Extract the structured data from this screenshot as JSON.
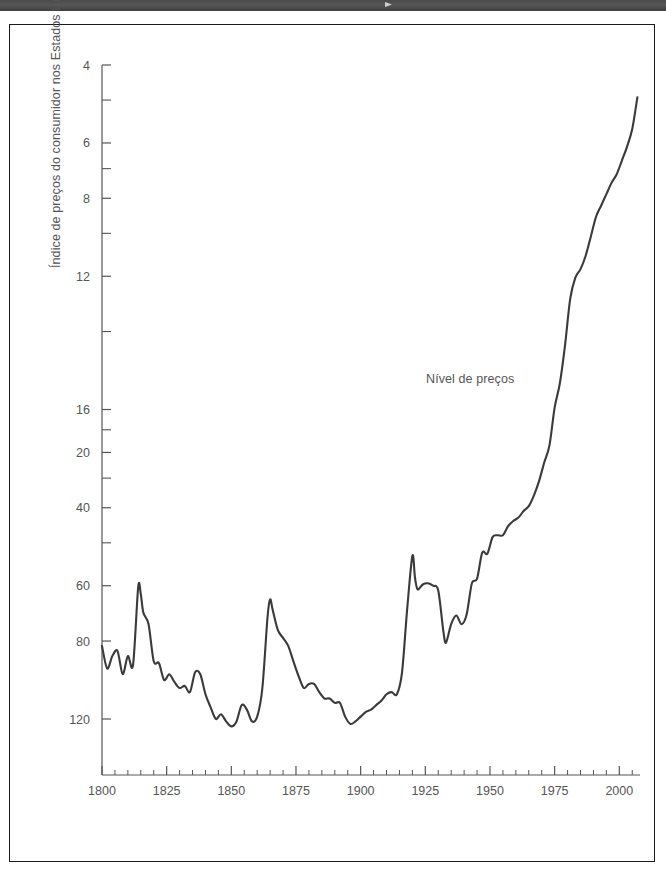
{
  "header": {
    "band_text": "",
    "marker": "triangle-marker"
  },
  "chart_data": {
    "type": "line",
    "title": "",
    "xlabel": "",
    "ylabel": "Índice de preços do consumidor nos Estados Unidos",
    "yscale": "log",
    "ylim": [
      3.0,
      120
    ],
    "xlim": [
      1800,
      2008
    ],
    "grid": false,
    "legend_position": "none",
    "annotations": [
      {
        "text": "Nível de preços",
        "x": 1958,
        "y": 26
      }
    ],
    "y_ticks_labeled": [
      4,
      6,
      8,
      12,
      16,
      20,
      40,
      60,
      80,
      120
    ],
    "y_ticks_minor": [
      10,
      14,
      18,
      30,
      50,
      70,
      100
    ],
    "x_ticks_labeled": [
      1800,
      1825,
      1850,
      1875,
      1900,
      1925,
      1950,
      1975,
      2000
    ],
    "x_tick_minor_step": 5,
    "series": [
      {
        "name": "Nível de preços",
        "color": "#3a3a3a",
        "x": [
          1800,
          1802,
          1804,
          1806,
          1808,
          1810,
          1812,
          1814,
          1815,
          1816,
          1818,
          1820,
          1822,
          1824,
          1826,
          1828,
          1830,
          1832,
          1834,
          1836,
          1838,
          1840,
          1842,
          1844,
          1846,
          1848,
          1850,
          1852,
          1854,
          1856,
          1858,
          1860,
          1862,
          1864,
          1865,
          1866,
          1868,
          1870,
          1872,
          1874,
          1876,
          1878,
          1880,
          1882,
          1884,
          1886,
          1888,
          1890,
          1892,
          1894,
          1896,
          1898,
          1900,
          1902,
          1904,
          1906,
          1908,
          1910,
          1912,
          1914,
          1916,
          1918,
          1920,
          1921,
          1922,
          1924,
          1926,
          1928,
          1930,
          1932,
          1933,
          1935,
          1937,
          1939,
          1941,
          1943,
          1945,
          1947,
          1949,
          1951,
          1953,
          1955,
          1957,
          1959,
          1961,
          1963,
          1965,
          1967,
          1969,
          1971,
          1973,
          1975,
          1977,
          1979,
          1981,
          1983,
          1985,
          1987,
          1989,
          1991,
          1993,
          1995,
          1997,
          1999,
          2001,
          2003,
          2005,
          2007
        ],
        "y": [
          5.85,
          5.2,
          5.55,
          5.7,
          5.05,
          5.55,
          5.3,
          7.95,
          7.65,
          6.95,
          6.55,
          5.4,
          5.35,
          4.9,
          5.05,
          4.85,
          4.7,
          4.75,
          4.6,
          5.1,
          5.05,
          4.55,
          4.25,
          4.0,
          4.1,
          3.95,
          3.85,
          3.95,
          4.3,
          4.2,
          3.95,
          4.05,
          4.7,
          6.8,
          7.45,
          7.05,
          6.35,
          6.1,
          5.85,
          5.4,
          5.0,
          4.7,
          4.8,
          4.8,
          4.6,
          4.45,
          4.45,
          4.35,
          4.35,
          4.05,
          3.9,
          3.95,
          4.05,
          4.15,
          4.2,
          4.3,
          4.4,
          4.55,
          4.6,
          4.55,
          5.1,
          7.1,
          9.35,
          8.35,
          7.85,
          8.05,
          8.1,
          8.0,
          7.8,
          6.3,
          5.95,
          6.55,
          6.85,
          6.55,
          6.9,
          8.1,
          8.3,
          9.5,
          9.45,
          10.3,
          10.4,
          10.4,
          10.9,
          11.2,
          11.4,
          11.8,
          12.1,
          12.8,
          13.8,
          15.2,
          16.6,
          20.2,
          22.9,
          27.9,
          35.5,
          39.7,
          41.5,
          44.5,
          49.2,
          54.5,
          57.8,
          61.3,
          65.0,
          68.0,
          73.0,
          78.5,
          86.0,
          101.5
        ]
      }
    ]
  },
  "axes": {
    "y_tick_labels": [
      "120",
      "80",
      "60",
      "40",
      "20",
      "16",
      "12",
      "8",
      "6",
      "4"
    ],
    "x_tick_labels": [
      "1800",
      "1825",
      "1850",
      "1875",
      "1900",
      "1925",
      "1950",
      "1975",
      "2000"
    ]
  }
}
